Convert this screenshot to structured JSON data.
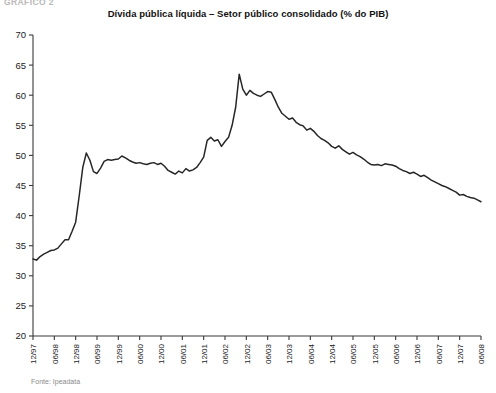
{
  "figure": {
    "exhibit_label": "GRÁFICO 2",
    "title": "Dívida pública líquida – Setor público consolidado (% do PIB)",
    "source_note": "Fonte: Ipeadata",
    "line_color": "#262626",
    "axis_color": "#3a3a3a",
    "background_color": "#ffffff"
  },
  "chart_data": {
    "type": "line",
    "title": "Dívida pública líquida – Setor público consolidado (% do PIB)",
    "subtitle": "",
    "xlabel": "",
    "ylabel": "",
    "ylim": [
      20,
      70
    ],
    "ytick_labels": [
      "20",
      "25",
      "30",
      "35",
      "40",
      "45",
      "50",
      "55",
      "60",
      "65",
      "70"
    ],
    "yticks": [
      20,
      25,
      30,
      35,
      40,
      45,
      50,
      55,
      60,
      65,
      70
    ],
    "grid": false,
    "legend": false,
    "legend_position": "none",
    "annotations": [],
    "xtick_labels": [
      "12/97",
      "06/98",
      "12/98",
      "06/99",
      "12/99",
      "06/00",
      "12/00",
      "06/01",
      "12/01",
      "06/02",
      "12/02",
      "06/03",
      "12/03",
      "06/04",
      "12/04",
      "06/05",
      "12/05",
      "06/06",
      "12/06",
      "06/07",
      "12/07",
      "06/08"
    ],
    "x_start": "12/97",
    "x_end": "06/08",
    "x_frequency": "monthly",
    "series": [
      {
        "name": "Dívida pública líquida (% do PIB)",
        "x": [
          "12/97",
          "01/98",
          "02/98",
          "03/98",
          "04/98",
          "05/98",
          "06/98",
          "07/98",
          "08/98",
          "09/98",
          "10/98",
          "11/98",
          "12/98",
          "01/99",
          "02/99",
          "03/99",
          "04/99",
          "05/99",
          "06/99",
          "07/99",
          "08/99",
          "09/99",
          "10/99",
          "11/99",
          "12/99",
          "01/00",
          "02/00",
          "03/00",
          "04/00",
          "05/00",
          "06/00",
          "07/00",
          "08/00",
          "09/00",
          "10/00",
          "11/00",
          "12/00",
          "01/01",
          "02/01",
          "03/01",
          "04/01",
          "05/01",
          "06/01",
          "07/01",
          "08/01",
          "09/01",
          "10/01",
          "11/01",
          "12/01",
          "01/02",
          "02/02",
          "03/02",
          "04/02",
          "05/02",
          "06/02",
          "07/02",
          "08/02",
          "09/02",
          "10/02",
          "11/02",
          "12/02",
          "01/03",
          "02/03",
          "03/03",
          "04/03",
          "05/03",
          "06/03",
          "07/03",
          "08/03",
          "09/03",
          "10/03",
          "11/03",
          "12/03",
          "01/04",
          "02/04",
          "03/04",
          "04/04",
          "05/04",
          "06/04",
          "07/04",
          "08/04",
          "09/04",
          "10/04",
          "11/04",
          "12/04",
          "01/05",
          "02/05",
          "03/05",
          "04/05",
          "05/05",
          "06/05",
          "07/05",
          "08/05",
          "09/05",
          "10/05",
          "11/05",
          "12/05",
          "01/06",
          "02/06",
          "03/06",
          "04/06",
          "05/06",
          "06/06",
          "07/06",
          "08/06",
          "09/06",
          "10/06",
          "11/06",
          "12/06",
          "01/07",
          "02/07",
          "03/07",
          "04/07",
          "05/07",
          "06/07",
          "07/07",
          "08/07",
          "09/07",
          "10/07",
          "11/07",
          "12/07",
          "01/08",
          "02/08",
          "03/08",
          "04/08",
          "05/08",
          "06/08"
        ],
        "values": [
          32.8,
          32.6,
          33.2,
          33.6,
          33.9,
          34.2,
          34.3,
          34.6,
          35.3,
          36.0,
          36.0,
          37.4,
          38.9,
          43.3,
          48.0,
          50.4,
          49.2,
          47.3,
          47.0,
          47.9,
          49.0,
          49.3,
          49.2,
          49.3,
          49.4,
          49.9,
          49.6,
          49.2,
          48.9,
          48.7,
          48.8,
          48.6,
          48.5,
          48.7,
          48.8,
          48.5,
          48.7,
          48.2,
          47.5,
          47.2,
          46.9,
          47.4,
          47.1,
          47.8,
          47.4,
          47.6,
          48.0,
          48.8,
          49.7,
          52.5,
          53.0,
          52.4,
          52.6,
          51.5,
          52.3,
          53.0,
          55.0,
          58.0,
          63.5,
          61.0,
          60.0,
          60.8,
          60.3,
          60.0,
          59.8,
          60.2,
          60.6,
          60.5,
          59.3,
          58.0,
          57.0,
          56.5,
          56.0,
          56.2,
          55.5,
          55.1,
          54.9,
          54.2,
          54.5,
          54.0,
          53.3,
          52.8,
          52.5,
          52.1,
          51.5,
          51.2,
          51.6,
          51.0,
          50.6,
          50.2,
          50.5,
          50.1,
          49.8,
          49.4,
          48.9,
          48.5,
          48.4,
          48.5,
          48.3,
          48.6,
          48.5,
          48.4,
          48.2,
          47.8,
          47.5,
          47.3,
          47.0,
          47.2,
          46.9,
          46.5,
          46.7,
          46.3,
          45.9,
          45.6,
          45.3,
          45.0,
          44.8,
          44.5,
          44.2,
          43.9,
          43.4,
          43.5,
          43.2,
          43.0,
          42.9,
          42.6,
          42.3
        ]
      }
    ]
  }
}
